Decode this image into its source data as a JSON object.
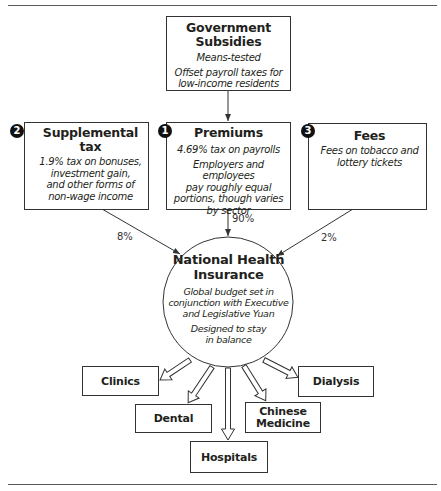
{
  "rules": {
    "top_y": 5,
    "bottom_y": 484
  },
  "funding_sources": {
    "government": {
      "title_line1": "Government",
      "title_line2": "Subsidies",
      "desc1": "Means-tested",
      "desc2_line1": "Offset payroll taxes for",
      "desc2_line2": "low-income residents"
    },
    "premiums": {
      "badge": "1",
      "title": "Premiums",
      "desc1": "4.69% tax on payrolls",
      "desc2_line1": "Employers and employees",
      "desc2_line2": "pay roughly equal",
      "desc2_line3": "portions, though varies",
      "desc2_line4": "by sector",
      "share": "90%"
    },
    "supplemental": {
      "badge": "2",
      "title": "Supplemental tax",
      "desc_line1": "1.9% tax on bonuses,",
      "desc_line2": "investment gain,",
      "desc_line3": "and other forms of",
      "desc_line4": "non-wage income",
      "share": "8%"
    },
    "fees": {
      "badge": "3",
      "title": "Fees",
      "desc_line1": "Fees on tobacco and",
      "desc_line2": "lottery tickets",
      "share": "2%"
    }
  },
  "nhi": {
    "title_line1": "National Health",
    "title_line2": "Insurance",
    "desc1_line1": "Global budget set in",
    "desc1_line2": "conjunction with Executive",
    "desc1_line3": "and Legislative Yuan",
    "desc2_line1": "Designed to stay",
    "desc2_line2": "in balance"
  },
  "providers": {
    "clinics": "Clinics",
    "dental": "Dental",
    "hospitals": "Hospitals",
    "chinese_medicine_line1": "Chinese",
    "chinese_medicine_line2": "Medicine",
    "dialysis": "Dialysis"
  },
  "colors": {
    "line": "#333333",
    "badge": "#111111",
    "text": "#231f20"
  }
}
